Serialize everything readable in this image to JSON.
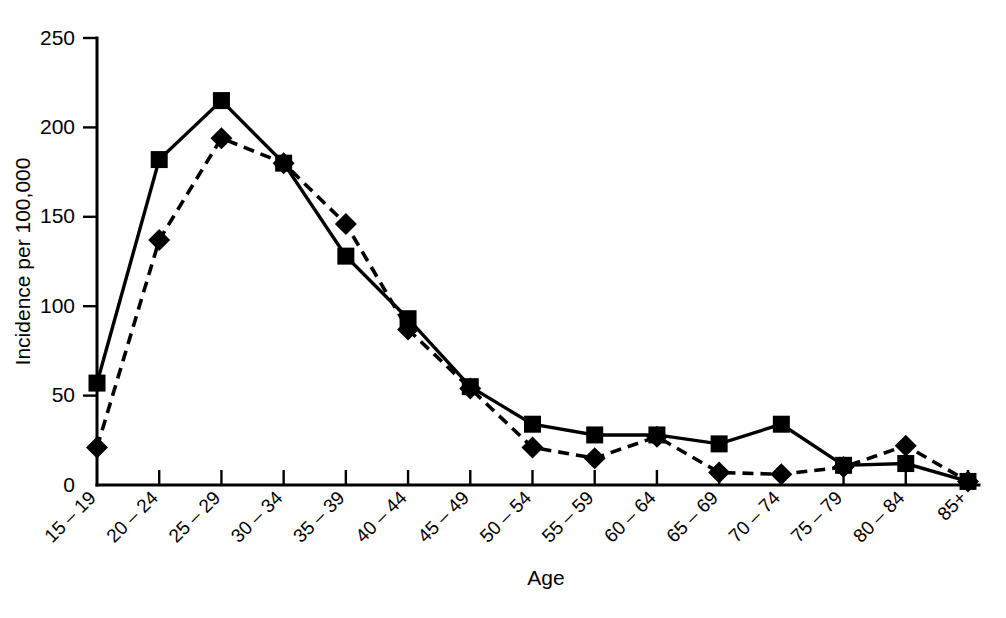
{
  "chart_data": {
    "type": "line",
    "title": "",
    "xlabel": "Age",
    "ylabel": "Incidence per 100,000",
    "categories": [
      "15 – 19",
      "20 – 24",
      "25 – 29",
      "30 – 34",
      "35 – 39",
      "40 – 44",
      "45 – 49",
      "50 – 54",
      "55 – 59",
      "60 – 64",
      "65 – 69",
      "70 – 74",
      "75 – 79",
      "80 – 84",
      "85+"
    ],
    "series": [
      {
        "name": "solid-square-series",
        "marker": "square",
        "linestyle": "solid",
        "color": "#000000",
        "values": [
          57,
          182,
          215,
          180,
          128,
          93,
          55,
          34,
          28,
          28,
          23,
          34,
          11,
          12,
          2
        ]
      },
      {
        "name": "dashed-diamond-series",
        "marker": "diamond",
        "linestyle": "dashed",
        "color": "#000000",
        "values": [
          21,
          137,
          194,
          180,
          146,
          87,
          54,
          21,
          15,
          27,
          7,
          6,
          10,
          22,
          2
        ]
      }
    ],
    "ylim": [
      0,
      250
    ],
    "yticks": [
      0,
      50,
      100,
      150,
      200,
      250
    ],
    "ytick_labels": [
      "0",
      "50",
      "100",
      "150",
      "200",
      "250"
    ],
    "grid": false,
    "legend": null,
    "legend_position": "none"
  },
  "caption": {
    "text": ""
  }
}
